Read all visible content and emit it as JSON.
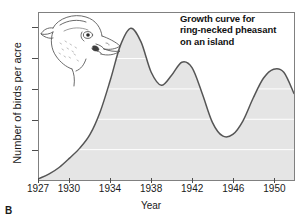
{
  "panel": {
    "label": "B"
  },
  "chart_title": {
    "line1": "Growth curve for",
    "line2": "ring-necked pheasant",
    "line3": "on an island"
  },
  "axes": {
    "xlabel": "Year",
    "ylabel": "Number of birds per acre",
    "yticks": [
      "1",
      "2",
      "3",
      "4",
      "5"
    ],
    "xticks": [
      "1927",
      "1930",
      "1934",
      "1938",
      "1942",
      "1946",
      "1950"
    ]
  },
  "illustration": {
    "name": "ring-necked-pheasant-head"
  },
  "colors": {
    "curve": "#555555",
    "area_fill": "#e5e5e5",
    "gridline": "#ffffff",
    "frame": "#808080",
    "text": "#1a1a1a"
  },
  "chart_data": {
    "type": "area",
    "title": "Growth curve for ring-necked pheasant on an island",
    "xlabel": "Year",
    "ylabel": "Number of birds per acre",
    "xlim": [
      1927,
      1952
    ],
    "ylim": [
      0,
      5.5
    ],
    "grid": true,
    "legend": null,
    "xticks": [
      1927,
      1930,
      1934,
      1938,
      1942,
      1946,
      1950
    ],
    "yticks": [
      1,
      2,
      3,
      4,
      5
    ],
    "series": [
      {
        "name": "Number of birds per acre",
        "x": [
          1927,
          1928,
          1929,
          1930,
          1931,
          1932,
          1933,
          1934,
          1935,
          1936,
          1937,
          1938,
          1939,
          1940,
          1941,
          1942,
          1943,
          1944,
          1945,
          1946,
          1947,
          1948,
          1949,
          1950,
          1951,
          1952
        ],
        "values": [
          0.05,
          0.2,
          0.42,
          0.72,
          1.05,
          1.5,
          2.25,
          3.3,
          4.45,
          5.0,
          4.55,
          3.55,
          3.12,
          3.45,
          3.88,
          3.7,
          2.85,
          1.9,
          1.45,
          1.5,
          1.95,
          2.7,
          3.35,
          3.65,
          3.55,
          2.85
        ]
      }
    ],
    "annotations": [
      {
        "name": "primary-peak",
        "x": 1936,
        "y": 5.0
      },
      {
        "name": "local-minimum",
        "x": 1939,
        "y": 3.12
      },
      {
        "name": "secondary-peak",
        "x": 1941,
        "y": 3.88
      },
      {
        "name": "trough",
        "x": 1945,
        "y": 1.45
      },
      {
        "name": "tertiary-peak",
        "x": 1950,
        "y": 3.65
      }
    ]
  }
}
